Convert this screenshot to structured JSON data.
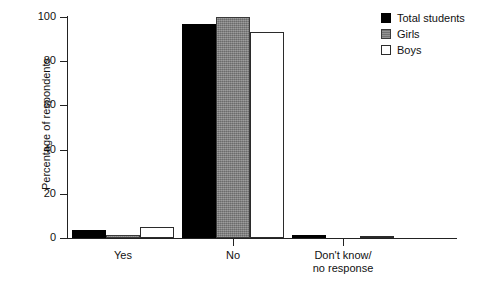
{
  "chart_data": {
    "type": "bar",
    "title": "",
    "xlabel": "",
    "ylabel": "Percentage of respondents",
    "ylim": [
      0,
      100
    ],
    "yticks": [
      0,
      20,
      40,
      60,
      80,
      100
    ],
    "ytick_labels": [
      "0",
      "20",
      "40",
      "60",
      "80",
      "100"
    ],
    "grid": false,
    "legend_position": "top-right",
    "categories": [
      "Yes",
      "No",
      "Don't know/\nno response"
    ],
    "category_labels": [
      {
        "line1": "Yes",
        "line2": ""
      },
      {
        "line1": "No",
        "line2": ""
      },
      {
        "line1": "Don't know/",
        "line2": "no response"
      }
    ],
    "series": [
      {
        "name": "Total students",
        "color": "#000000",
        "values": [
          3.5,
          97,
          1.5
        ]
      },
      {
        "name": "Girls",
        "color": "#808080",
        "values": [
          1.5,
          100,
          0
        ]
      },
      {
        "name": "Boys",
        "color": "#ffffff",
        "values": [
          5,
          93,
          1
        ]
      }
    ]
  },
  "legend": {
    "items": [
      {
        "label": "Total students",
        "swatch": "black-filled-square"
      },
      {
        "label": "Girls",
        "swatch": "gray-filled-square"
      },
      {
        "label": "Boys",
        "swatch": "white-outlined-square"
      }
    ]
  },
  "axis": {
    "y_title": "Percentage of respondents"
  }
}
